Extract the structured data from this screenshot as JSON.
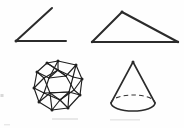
{
  "figure": {
    "title": "Geometry shapes worksheet figure",
    "background_color": "#fefefe",
    "ink_color": "#2b2b2b",
    "width": 184,
    "height": 128,
    "shape_count": "4",
    "shapes": [
      {
        "id": "angle",
        "label": "Angle",
        "description": "Acute angle formed by two rays meeting at a common vertex",
        "quadrant": "top-left",
        "vertex": "16,41",
        "ray_1_end": "52,8",
        "ray_2_end": "66,41",
        "stroke_width": "2.0"
      },
      {
        "id": "triangle",
        "label": "Triangle",
        "description": "Scalene obtuse triangle with a long horizontal base",
        "quadrant": "top-right",
        "apex": "122,12",
        "base_left": "92,42",
        "base_right": "178,42",
        "stroke_width": "2.0"
      },
      {
        "id": "polyhedron",
        "label": "Polyhedron",
        "description": "Wireframe icosahedron drawn with all visible and hidden edges",
        "quadrant": "bottom-left",
        "center": "58,86",
        "radius": "25",
        "vertex_count": "12",
        "stroke_width": "1.15"
      },
      {
        "id": "cone",
        "label": "Cone",
        "description": "Right circular cone with dashed hidden half of the base ellipse",
        "quadrant": "bottom-right",
        "apex": "133,62",
        "base_center": "133,103",
        "base_rx": "22",
        "base_ry": "8",
        "hidden_edge_style": "dashed",
        "stroke_width": "1.6"
      }
    ],
    "artifacts": {
      "left_edge_speck": "faint scan speck at left margin",
      "bottom_smudge": "faint grey scan smudge along bottom edge"
    }
  }
}
